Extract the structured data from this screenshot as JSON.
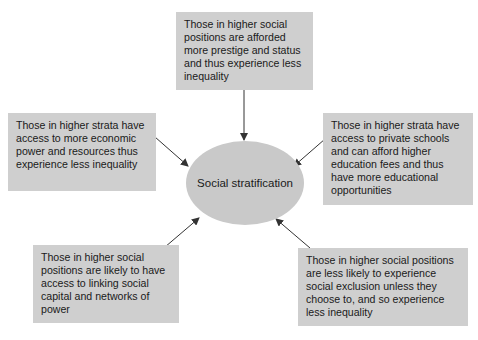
{
  "diagram": {
    "center": {
      "label": "Social stratification"
    },
    "boxes": [
      {
        "id": "top",
        "text": "Those in higher social positions are afforded more prestige and status and thus experience less inequality"
      },
      {
        "id": "left",
        "text": "Those in higher strata have access to more economic power and resources thus experience less inequality"
      },
      {
        "id": "right",
        "text": "Those in higher strata have access to private schools and can afford higher education fees and thus have more educational opportunities"
      },
      {
        "id": "bottom-left",
        "text": "Those in higher social positions are likely to have access to linking social capital and networks of power"
      },
      {
        "id": "bottom-right",
        "text": "Those in higher social positions are less likely to experience social exclusion unless they choose to, and so experience less inequality"
      }
    ],
    "colors": {
      "box_fill": "#cfcfcf",
      "ellipse_fill": "#c9c9c9",
      "arrow": "#333333"
    }
  }
}
